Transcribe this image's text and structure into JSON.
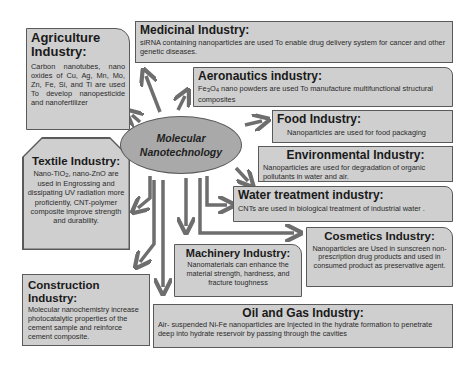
{
  "center": {
    "line1": "Molecular",
    "line2": "Nanotechnology"
  },
  "industries": {
    "agriculture": {
      "title_line1": "Agriculture",
      "title_line2": "Industry:",
      "description": "Carbon nanotubes, nano oxides of Cu, Ag, Mn, Mo, Zn, Fe, Si, and Ti are used To develop nanopesticide and nanofertilizer"
    },
    "medicinal": {
      "title": "Medicinal Industry:",
      "description": "siRNA containing nanoparticles are used To enable drug delivery system for cancer and other genetic diseases."
    },
    "aeronautics": {
      "title": "Aeronautics industry:",
      "description_prefix": "Fe",
      "description_sub1": "3",
      "description_mid": "O",
      "description_sub2": "4",
      "description_suffix": " nano powders are used To manufacture multifunctional structural composites"
    },
    "food": {
      "title": "Food Industry:",
      "description": "Nanoparticles are used for food packaging"
    },
    "environmental": {
      "title": "Environmental Industry:",
      "description": "Nanoparticles are used for degradation of organic pollutants in water and air."
    },
    "water": {
      "title": "Water treatment industry:",
      "description": "CNTs are used in biological treatment of industrial water ."
    },
    "textile": {
      "title": "Textile Industry:",
      "description_prefix": "Nano-TiO",
      "description_sub": "2",
      "description_suffix": ", nano-ZnO are used in Engrossing and dissipating UV radiation more proficiently, CNT-polymer composite improve strength and durability."
    },
    "cosmetics": {
      "title": "Cosmetics Industry:",
      "description": "Nanoparticles are Used in sunscreen non-prescription drug products and used in consumed product as preservative agent."
    },
    "machinery": {
      "title": "Machinery Industry:",
      "description": "Nanomaterials can enhance the material strength, hardness, and fracture toughness"
    },
    "construction": {
      "title": "Construction Industry:",
      "description": "Molecular nanochemistry increase photocatalytic properties of the cement sample and reinforce cement composite."
    },
    "oil_gas": {
      "title": "Oil and Gas Industry:",
      "description": "Air- suspended Ni-Fe nanoparticles are Injected in the hydrate formation to penetrate deep into hydrate reservoir by passing through the cavities"
    }
  },
  "colors": {
    "box_fill": "#cfcfcf",
    "ellipse_fill": "#a9a9a9",
    "arrow": "#6e6e6e",
    "border": "#5a5a5a"
  }
}
